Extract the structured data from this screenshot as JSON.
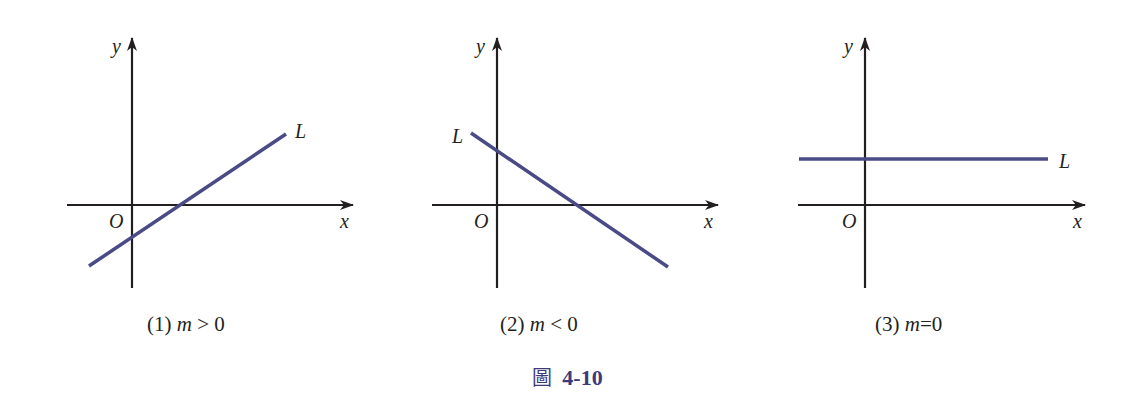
{
  "figure": {
    "title_char": "圖",
    "title_number": "4-10",
    "line_color": "#4a4a86",
    "axis_color": "#231f20"
  },
  "panels": [
    {
      "caption_num": "(1)",
      "caption_var": "m",
      "caption_rel": " > 0",
      "x_label": "x",
      "y_label": "y",
      "origin_label": "O",
      "line_label": "L",
      "slope": "positive"
    },
    {
      "caption_num": "(2)",
      "caption_var": "m",
      "caption_rel": " < 0",
      "x_label": "x",
      "y_label": "y",
      "origin_label": "O",
      "line_label": "L",
      "slope": "negative"
    },
    {
      "caption_num": "(3)",
      "caption_var": "m",
      "caption_rel": "=0",
      "x_label": "x",
      "y_label": "y",
      "origin_label": "O",
      "line_label": "L",
      "slope": "zero"
    }
  ]
}
